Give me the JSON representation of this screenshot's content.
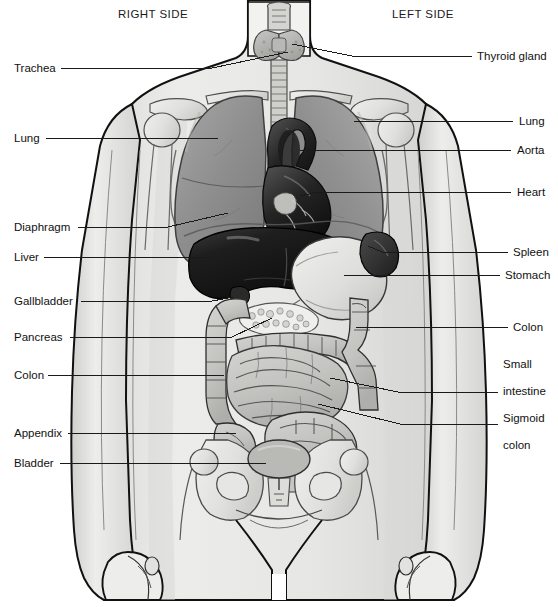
{
  "diagram": {
    "orientation_headings": {
      "right": "RIGHT SIDE",
      "left": "LEFT SIDE"
    },
    "canvas": {
      "width": 558,
      "height": 607
    },
    "palette": {
      "background": "#ffffff",
      "skin_fill": "#e9e9e7",
      "skin_shadow": "#d6d6d4",
      "bone_fill": "#e3e3e1",
      "bone_edge": "#5d5d5d",
      "outline": "#111111",
      "lung_fill": "#8f8f8f",
      "lung_light": "#a6a6a6",
      "lung_dark": "#7a7a7a",
      "heart_fill": "#3a3a3a",
      "heart_dark": "#151515",
      "aorta_fill": "#2a2a2a",
      "liver_fill": "#1a1a1a",
      "liver_highlight": "#4a4a4a",
      "stomach_fill": "#dcdcda",
      "spleen_fill": "#2f2f2f",
      "intestine_fill": "#c9c9c6",
      "intestine_shade": "#ababa8",
      "pancreas_fill": "#efefed",
      "bladder_fill": "#b9b9b6",
      "thyroid_fill": "#b3b3b0",
      "trachea_fill": "#cfcfcc",
      "leader_line": "#1a1a1a",
      "label_text": "#111111"
    },
    "labels_left": [
      {
        "id": "trachea",
        "text": "Trachea",
        "x": 14,
        "y": 62,
        "line": {
          "x1": 61,
          "y1": 68,
          "x2": 212,
          "y2": 68,
          "x3": 288,
          "y3": 52
        }
      },
      {
        "id": "lung-right",
        "text": "Lung",
        "x": 14,
        "y": 132,
        "line": {
          "x1": 46,
          "y1": 138,
          "x2": 218,
          "y2": 138,
          "x3": 218,
          "y3": 138
        }
      },
      {
        "id": "diaphragm",
        "text": "Diaphragm",
        "x": 14,
        "y": 221,
        "line": {
          "x1": 78,
          "y1": 227,
          "x2": 168,
          "y2": 227,
          "x3": 228,
          "y3": 213
        }
      },
      {
        "id": "liver",
        "text": "Liver",
        "x": 14,
        "y": 251,
        "line": {
          "x1": 44,
          "y1": 257,
          "x2": 240,
          "y2": 257,
          "x3": 240,
          "y3": 257
        }
      },
      {
        "id": "gallbladder",
        "text": "Gallbladder",
        "x": 14,
        "y": 295,
        "line": {
          "x1": 81,
          "y1": 301,
          "x2": 212,
          "y2": 301,
          "x3": 232,
          "y3": 296
        }
      },
      {
        "id": "pancreas",
        "text": "Pancreas",
        "x": 14,
        "y": 331,
        "line": {
          "x1": 70,
          "y1": 337,
          "x2": 232,
          "y2": 337,
          "x3": 272,
          "y3": 318
        }
      },
      {
        "id": "colon-left",
        "text": "Colon",
        "x": 14,
        "y": 369,
        "line": {
          "x1": 48,
          "y1": 375,
          "x2": 224,
          "y2": 375,
          "x3": 224,
          "y3": 375
        }
      },
      {
        "id": "appendix",
        "text": "Appendix",
        "x": 14,
        "y": 427,
        "line": {
          "x1": 68,
          "y1": 433,
          "x2": 236,
          "y2": 433,
          "x3": 236,
          "y3": 433
        }
      },
      {
        "id": "bladder",
        "text": "Bladder",
        "x": 14,
        "y": 457,
        "line": {
          "x1": 60,
          "y1": 463,
          "x2": 266,
          "y2": 463,
          "x3": 278,
          "y3": 459
        }
      }
    ],
    "labels_right": [
      {
        "id": "thyroid-gland",
        "text": "Thyroid gland",
        "x": 477,
        "y": 50,
        "line": {
          "x1": 472,
          "y1": 56,
          "x2": 352,
          "y2": 56,
          "x3": 292,
          "y3": 44
        }
      },
      {
        "id": "lung-left",
        "text": "Lung",
        "x": 519,
        "y": 115,
        "line": {
          "x1": 513,
          "y1": 121,
          "x2": 354,
          "y2": 121,
          "x3": 354,
          "y3": 121
        }
      },
      {
        "id": "aorta",
        "text": "Aorta",
        "x": 517,
        "y": 144,
        "line": {
          "x1": 511,
          "y1": 150,
          "x2": 316,
          "y2": 150,
          "x3": 300,
          "y3": 150
        }
      },
      {
        "id": "heart",
        "text": "Heart",
        "x": 517,
        "y": 186,
        "line": {
          "x1": 511,
          "y1": 192,
          "x2": 318,
          "y2": 192,
          "x3": 300,
          "y3": 196
        }
      },
      {
        "id": "spleen",
        "text": "Spleen",
        "x": 513,
        "y": 246,
        "line": {
          "x1": 508,
          "y1": 252,
          "x2": 380,
          "y2": 252,
          "x3": 368,
          "y3": 246
        }
      },
      {
        "id": "stomach",
        "text": "Stomach",
        "x": 505,
        "y": 269,
        "line": {
          "x1": 500,
          "y1": 275,
          "x2": 344,
          "y2": 275,
          "x3": 344,
          "y3": 275
        }
      },
      {
        "id": "colon-right",
        "text": "Colon",
        "x": 513,
        "y": 321,
        "line": {
          "x1": 508,
          "y1": 327,
          "x2": 370,
          "y2": 327,
          "x3": 356,
          "y3": 327
        }
      },
      {
        "id": "small-intestine",
        "text": "Small\nintestine",
        "x": 503,
        "y": 358,
        "line": {
          "x1": 498,
          "y1": 392,
          "x2": 398,
          "y2": 392,
          "x3": 330,
          "y3": 378
        }
      },
      {
        "id": "sigmoid-colon",
        "text": "Sigmoid\ncolon",
        "x": 503,
        "y": 412,
        "line": {
          "x1": 498,
          "y1": 424,
          "x2": 400,
          "y2": 424,
          "x3": 318,
          "y3": 404
        }
      }
    ],
    "label_lines_multiline": {
      "small-intestine": [
        "Small",
        "intestine"
      ],
      "sigmoid-colon": [
        "Sigmoid",
        "colon"
      ]
    },
    "organs": [
      {
        "id": "thyroid-gland",
        "name": "Thyroid gland",
        "side": "midline"
      },
      {
        "id": "trachea",
        "name": "Trachea",
        "side": "midline"
      },
      {
        "id": "lung-right",
        "name": "Lung",
        "side": "right"
      },
      {
        "id": "lung-left",
        "name": "Lung",
        "side": "left"
      },
      {
        "id": "heart",
        "name": "Heart",
        "side": "midline"
      },
      {
        "id": "aorta",
        "name": "Aorta",
        "side": "midline"
      },
      {
        "id": "diaphragm",
        "name": "Diaphragm",
        "side": "midline"
      },
      {
        "id": "liver",
        "name": "Liver",
        "side": "right"
      },
      {
        "id": "gallbladder",
        "name": "Gallbladder",
        "side": "right"
      },
      {
        "id": "stomach",
        "name": "Stomach",
        "side": "left"
      },
      {
        "id": "spleen",
        "name": "Spleen",
        "side": "left"
      },
      {
        "id": "pancreas",
        "name": "Pancreas",
        "side": "midline"
      },
      {
        "id": "colon",
        "name": "Colon",
        "side": "both"
      },
      {
        "id": "small-intestine",
        "name": "Small intestine",
        "side": "midline"
      },
      {
        "id": "appendix",
        "name": "Appendix",
        "side": "right"
      },
      {
        "id": "sigmoid-colon",
        "name": "Sigmoid colon",
        "side": "left"
      },
      {
        "id": "bladder",
        "name": "Bladder",
        "side": "midline"
      }
    ]
  }
}
